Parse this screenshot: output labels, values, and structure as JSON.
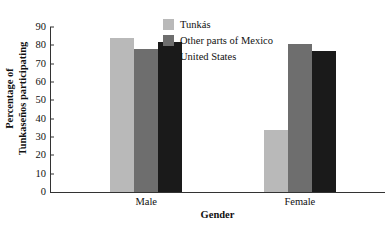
{
  "chart_data": {
    "type": "bar",
    "title": "",
    "xlabel": "Gender",
    "ylabel": "Percentage of Tunkaseños participating",
    "ylabel_line1": "Percentage of",
    "ylabel_line2": "Tunkaseños participating",
    "categories": [
      "Male",
      "Female"
    ],
    "series": [
      {
        "name": "Tunkás",
        "values": [
          84,
          34
        ],
        "color": "#b9b9b9"
      },
      {
        "name": "Other parts of Mexico",
        "values": [
          78,
          81
        ],
        "color": "#6e6e6e"
      },
      {
        "name": "United States",
        "values": [
          82,
          77
        ],
        "color": "#1a1a1a"
      }
    ],
    "ylim": [
      0,
      90
    ],
    "ytick_step": 10,
    "yticks": [
      0,
      10,
      20,
      30,
      40,
      50,
      60,
      70,
      80,
      90
    ],
    "ytick_labels": [
      "0",
      "10",
      "20",
      "30",
      "40",
      "50",
      "60",
      "70",
      "80",
      "90"
    ],
    "grid": false,
    "legend_position": "upper-center"
  }
}
